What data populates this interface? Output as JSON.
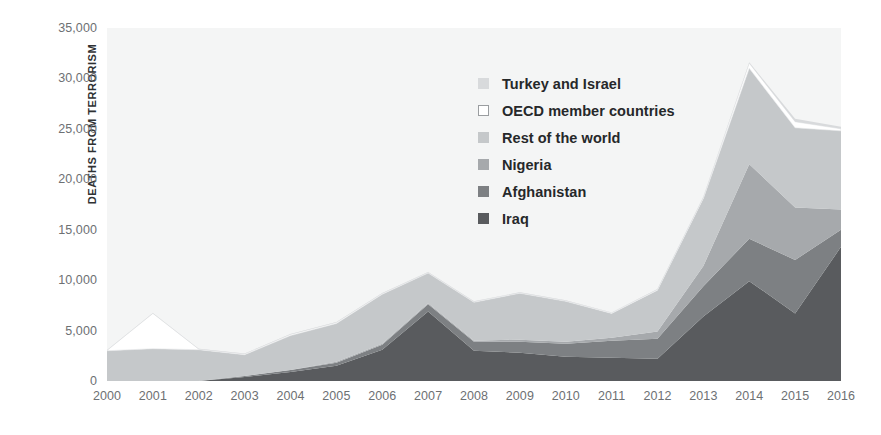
{
  "chart_data": {
    "type": "area",
    "stacked": true,
    "title": "",
    "subtitle": "",
    "xlabel": "",
    "ylabel": "DEATHS FROM TERRORISM",
    "x": [
      2000,
      2001,
      2002,
      2003,
      2004,
      2005,
      2006,
      2007,
      2008,
      2009,
      2010,
      2011,
      2012,
      2013,
      2014,
      2015,
      2016
    ],
    "categories": [
      "2000",
      "2001",
      "2002",
      "2003",
      "2004",
      "2005",
      "2006",
      "2007",
      "2008",
      "2009",
      "2010",
      "2011",
      "2012",
      "2013",
      "2014",
      "2015",
      "2016"
    ],
    "xlim": [
      2000,
      2016
    ],
    "ylim": [
      0,
      35000
    ],
    "y_ticks": [
      0,
      5000,
      10000,
      15000,
      20000,
      25000,
      30000,
      35000
    ],
    "y_tick_labels": [
      "0",
      "5,000",
      "10,000",
      "15,000",
      "20,000",
      "25,000",
      "30,000",
      "35,000"
    ],
    "grid": false,
    "legend_position": "inside-upper-center",
    "stack_order_bottom_to_top": [
      "Iraq",
      "Afghanistan",
      "Nigeria",
      "Rest of the world",
      "OECD member countries",
      "Turkey and Israel"
    ],
    "series": [
      {
        "name": "Iraq",
        "color": "#595b5e",
        "values": [
          0,
          0,
          0,
          400,
          900,
          1500,
          3100,
          6900,
          3000,
          2800,
          2400,
          2300,
          2200,
          6400,
          9900,
          6700,
          13300
        ]
      },
      {
        "name": "Afghanistan",
        "color": "#7d8083",
        "values": [
          0,
          0,
          0,
          100,
          200,
          300,
          500,
          700,
          900,
          1100,
          1300,
          1700,
          2000,
          3000,
          4200,
          5300,
          1700
        ]
      },
      {
        "name": "Nigeria",
        "color": "#a6a9ac",
        "values": [
          0,
          0,
          0,
          0,
          0,
          100,
          100,
          100,
          100,
          200,
          200,
          300,
          700,
          2000,
          7400,
          5200,
          2000
        ]
      },
      {
        "name": "Rest of the world",
        "color": "#c5c8ca",
        "values": [
          3000,
          3200,
          3100,
          2100,
          3400,
          3800,
          4900,
          3000,
          3800,
          4600,
          4000,
          2400,
          4100,
          6700,
          9500,
          7900,
          7800
        ]
      },
      {
        "name": "OECD member countries",
        "color": "#ffffff",
        "values": [
          30,
          3500,
          60,
          80,
          120,
          100,
          80,
          60,
          70,
          60,
          60,
          60,
          80,
          100,
          500,
          600,
          200
        ]
      },
      {
        "name": "Turkey and Israel",
        "color": "#d8dadc",
        "values": [
          40,
          50,
          40,
          40,
          50,
          50,
          40,
          40,
          40,
          40,
          40,
          40,
          50,
          60,
          100,
          300,
          200
        ]
      }
    ],
    "annotations": []
  },
  "legend": {
    "items": [
      {
        "label": "Turkey and Israel",
        "swatch": "#d8dadc",
        "style": "filled"
      },
      {
        "label": "OECD member countries",
        "swatch": "#ffffff",
        "style": "hollow"
      },
      {
        "label": "Rest of the world",
        "swatch": "#c5c8ca",
        "style": "filled"
      },
      {
        "label": "Nigeria",
        "swatch": "#a6a9ac",
        "style": "filled"
      },
      {
        "label": "Afghanistan",
        "swatch": "#7d8083",
        "style": "filled"
      },
      {
        "label": "Iraq",
        "swatch": "#595b5e",
        "style": "filled"
      }
    ]
  },
  "axis": {
    "y_title": "DEATHS FROM TERRORISM"
  },
  "colors": {
    "plot_background": "#f4f5f5",
    "tick_text": "#6d7073",
    "axis_title": "#2f3133",
    "legend_text": "#26282a"
  }
}
